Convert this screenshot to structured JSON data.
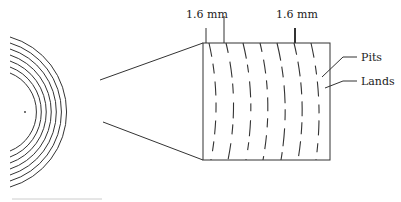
{
  "diagram": {
    "title": "",
    "labels": {
      "track_pitch_left": "1.6 mm",
      "track_pitch_right": "1.6 mm",
      "pits": "Pits",
      "lands": "Lands"
    },
    "colors": {
      "stroke": "#333333",
      "background": "#ffffff"
    },
    "disc": {
      "center": [
        25,
        112
      ],
      "ring_radii": [
        42,
        48,
        54,
        60,
        66,
        72,
        78
      ],
      "ring_count": 7
    },
    "magnified_view": {
      "rect": {
        "x": 203,
        "y": 43,
        "width": 127,
        "height": 117
      },
      "track_count": 7
    }
  }
}
